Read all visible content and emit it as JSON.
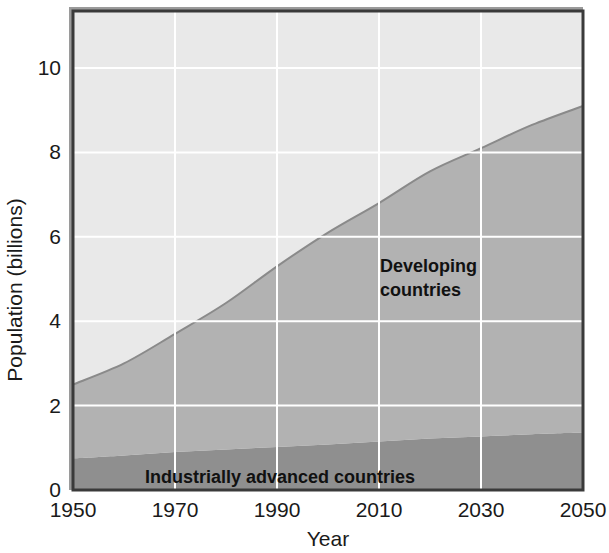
{
  "chart_data": {
    "type": "area",
    "stacked": true,
    "title": "",
    "xlabel": "Year",
    "ylabel": "Population (billions)",
    "x": [
      1950,
      1960,
      1970,
      1980,
      1990,
      2000,
      2010,
      2020,
      2030,
      2040,
      2050
    ],
    "xlim": [
      1950,
      2050
    ],
    "ylim": [
      0,
      11.35
    ],
    "xticks": [
      "1950",
      "1970",
      "1990",
      "2010",
      "2030",
      "2050"
    ],
    "xtick_values": [
      1950,
      1970,
      1990,
      2010,
      2030,
      2050
    ],
    "yticks": [
      "0",
      "2",
      "4",
      "6",
      "8",
      "10"
    ],
    "ytick_values": [
      0,
      2,
      4,
      6,
      8,
      10
    ],
    "grid": true,
    "grid_color": "#ffffff",
    "legend_position": "inline-annotations",
    "series": [
      {
        "name": "Industrially advanced countries",
        "label": "Industrially advanced countries",
        "color": "#8f8f8f",
        "values": [
          0.75,
          0.82,
          0.9,
          0.96,
          1.02,
          1.08,
          1.15,
          1.22,
          1.27,
          1.32,
          1.36
        ]
      },
      {
        "name": "Developing countries",
        "label": "Developing countries",
        "color": "#b2b2b2",
        "values": [
          1.75,
          2.18,
          2.8,
          3.47,
          4.28,
          5.02,
          5.65,
          6.33,
          6.83,
          7.33,
          7.74
        ]
      }
    ],
    "total_values": [
      2.5,
      3.0,
      3.7,
      4.43,
      5.3,
      6.1,
      6.8,
      7.55,
      8.1,
      8.65,
      9.1
    ],
    "background_color": "#e9e9e9",
    "plot_border_color": "#3a3a3a"
  },
  "axis": {
    "y_title": "Population (billions)",
    "x_title": "Year",
    "y_tick_labels": [
      "10",
      "8",
      "6",
      "4",
      "2",
      "0"
    ],
    "x_tick_labels": [
      "1950",
      "1970",
      "1990",
      "2010",
      "2030",
      "2050"
    ]
  },
  "annotations": {
    "developing_line1": "Developing",
    "developing_line2": "countries",
    "advanced": "Industrially advanced countries"
  },
  "colors": {
    "plot_background": "#e9e9e9",
    "developing_band": "#b2b2b2",
    "advanced_band": "#8f8f8f",
    "grid": "#ffffff",
    "border": "#3a3a3a",
    "text": "#1a1a1a"
  }
}
